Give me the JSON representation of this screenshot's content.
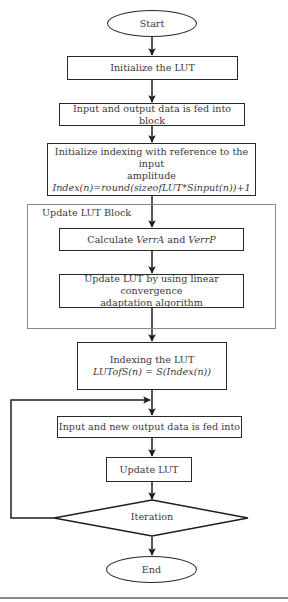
{
  "diagram": {
    "type": "flowchart",
    "nodes": {
      "start": {
        "label": "Start",
        "shape": "ellipse"
      },
      "init_lut": {
        "label": "Initialize the LUT",
        "shape": "rect"
      },
      "feed_data": {
        "label": "Input and output data is fed into block",
        "shape": "rect"
      },
      "init_index": {
        "label_line1": "Initialize indexing with reference to the input",
        "label_line2": "amplitude",
        "formula": "Index(n)=round(sizeofLUT*Sinput(n))+1",
        "shape": "rect"
      },
      "update_block": {
        "label": "Update LUT Block",
        "shape": "group"
      },
      "calc_verr": {
        "label_pre": "Calculate ",
        "var1": "VerrA",
        "label_mid": " and ",
        "var2": "VerrP",
        "shape": "rect"
      },
      "update_linear": {
        "label_line1": "Update LUT by using linear convergence",
        "label_line2": "adaptation algorithm",
        "shape": "rect"
      },
      "index_lut": {
        "label": "Indexing the LUT",
        "formula": "LUTofS(n) = S(Index(n))",
        "shape": "rect"
      },
      "feed_new": {
        "label": "Input and new output data is fed into",
        "shape": "rect"
      },
      "update_lut": {
        "label": "Update LUT",
        "shape": "rect"
      },
      "iteration": {
        "label": "Iteration",
        "shape": "diamond"
      },
      "end": {
        "label": "End",
        "shape": "ellipse"
      }
    },
    "edges": [
      [
        "start",
        "init_lut"
      ],
      [
        "init_lut",
        "feed_data"
      ],
      [
        "feed_data",
        "init_index"
      ],
      [
        "init_index",
        "calc_verr"
      ],
      [
        "calc_verr",
        "update_linear"
      ],
      [
        "update_linear",
        "index_lut"
      ],
      [
        "index_lut",
        "feed_new"
      ],
      [
        "feed_new",
        "update_lut"
      ],
      [
        "update_lut",
        "iteration"
      ],
      [
        "iteration",
        "end"
      ],
      [
        "iteration",
        "feed_new",
        "loop-back"
      ]
    ]
  }
}
